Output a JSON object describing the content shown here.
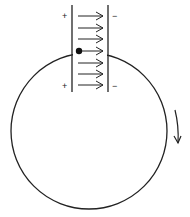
{
  "diagram": {
    "stroke_color": "#222222",
    "background": "#ffffff",
    "circle": {
      "cx": 89,
      "cy": 131,
      "r": 78
    },
    "plates": {
      "left": {
        "x": 72,
        "y1": 5,
        "y2": 92,
        "sign_top": "+",
        "sign_bottom": "+"
      },
      "right": {
        "x": 108,
        "y1": 5,
        "y2": 92,
        "sign_top": "−",
        "sign_bottom": "−"
      }
    },
    "field_arrows": {
      "count": 7,
      "direction": "right",
      "y_positions": [
        16,
        28,
        39,
        51,
        63,
        74,
        85
      ]
    },
    "particle": {
      "x": 79,
      "y": 51,
      "label": ""
    },
    "rotation_arrow": {
      "direction": "clockwise",
      "x": 178,
      "y1": 110,
      "y2": 143
    }
  }
}
